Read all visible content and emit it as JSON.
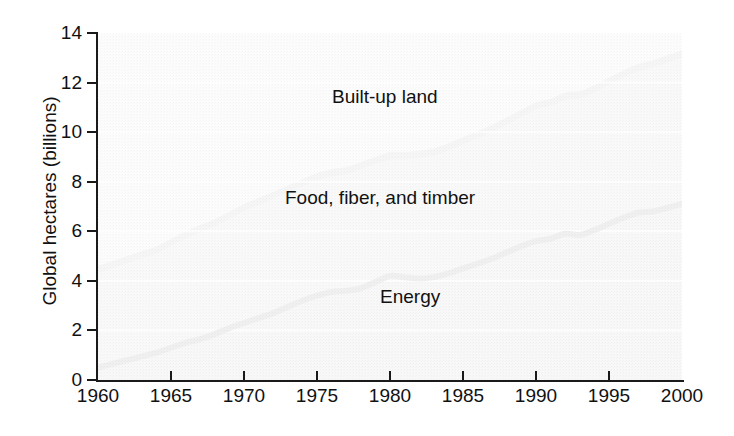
{
  "chart_data": {
    "type": "area",
    "stacked": true,
    "title": "",
    "subtitle": "",
    "xlabel": "",
    "ylabel": "Global hectares (billions)",
    "xlim": [
      1960,
      2000
    ],
    "ylim": [
      0,
      14
    ],
    "x_ticks": [
      1960,
      1965,
      1970,
      1975,
      1980,
      1985,
      1990,
      1995,
      2000
    ],
    "x_tick_labels": [
      "1960",
      "1965",
      "1970",
      "1975",
      "1980",
      "1985",
      "1990",
      "1995",
      "2000"
    ],
    "y_ticks": [
      0,
      2,
      4,
      6,
      8,
      10,
      12,
      14
    ],
    "y_tick_labels": [
      "0",
      "2",
      "4",
      "6",
      "8",
      "10",
      "12",
      "14"
    ],
    "grid": "horizontal-white-lines",
    "legend_position": "in-plot-annotations",
    "annotations": [
      {
        "text": "Built-up land",
        "series": "built-up-land"
      },
      {
        "text": "Food, fiber, and timber",
        "series": "food-fiber-timber"
      },
      {
        "text": "Energy",
        "series": "energy"
      }
    ],
    "colors": {
      "energy_fill": "#b4b4b4",
      "food_fill": "#c3c3c3",
      "builtup_fill": "#e3e3e3",
      "energy_line": "#6e6e6e",
      "builtup_band_edge": "#9e9e9e",
      "axis": "#1a1a1a",
      "gridline": "#ffffff",
      "text": "#111111"
    },
    "x": [
      1960,
      1961,
      1962,
      1963,
      1964,
      1965,
      1966,
      1967,
      1968,
      1969,
      1970,
      1971,
      1972,
      1973,
      1974,
      1975,
      1976,
      1977,
      1978,
      1979,
      1980,
      1981,
      1982,
      1983,
      1984,
      1985,
      1986,
      1987,
      1988,
      1989,
      1990,
      1991,
      1992,
      1993,
      1994,
      1995,
      1996,
      1997,
      1998,
      1999,
      2000
    ],
    "series": [
      {
        "name": "Energy",
        "key": "energy",
        "values": [
          0.5,
          0.65,
          0.8,
          0.95,
          1.1,
          1.3,
          1.5,
          1.65,
          1.85,
          2.1,
          2.3,
          2.5,
          2.7,
          2.95,
          3.2,
          3.4,
          3.55,
          3.6,
          3.7,
          3.95,
          4.2,
          4.15,
          4.1,
          4.15,
          4.3,
          4.5,
          4.7,
          4.9,
          5.15,
          5.4,
          5.6,
          5.7,
          5.9,
          5.85,
          6.05,
          6.3,
          6.55,
          6.75,
          6.8,
          6.95,
          7.1
        ]
      },
      {
        "name": "Food, fiber, and timber",
        "key": "food-fiber-timber",
        "values": [
          3.8,
          3.85,
          3.9,
          3.95,
          4.0,
          4.1,
          4.2,
          4.3,
          4.35,
          4.4,
          4.5,
          4.55,
          4.6,
          4.6,
          4.6,
          4.65,
          4.65,
          4.7,
          4.8,
          4.75,
          4.7,
          4.75,
          4.85,
          4.9,
          4.95,
          5.0,
          5.05,
          5.1,
          5.15,
          5.2,
          5.3,
          5.35,
          5.4,
          5.5,
          5.55,
          5.6,
          5.65,
          5.7,
          5.8,
          5.85,
          5.9
        ]
      },
      {
        "name": "Built-up land",
        "key": "built-up-land",
        "values": [
          0.3,
          0.3,
          0.3,
          0.3,
          0.3,
          0.3,
          0.3,
          0.3,
          0.3,
          0.3,
          0.3,
          0.3,
          0.3,
          0.3,
          0.3,
          0.3,
          0.3,
          0.3,
          0.3,
          0.3,
          0.3,
          0.3,
          0.3,
          0.3,
          0.3,
          0.3,
          0.3,
          0.3,
          0.3,
          0.3,
          0.3,
          0.3,
          0.3,
          0.3,
          0.3,
          0.3,
          0.3,
          0.3,
          0.3,
          0.3,
          0.3
        ]
      }
    ],
    "cumulative": {
      "energy_top": [
        0.5,
        0.65,
        0.8,
        0.95,
        1.1,
        1.3,
        1.5,
        1.65,
        1.85,
        2.1,
        2.3,
        2.5,
        2.7,
        2.95,
        3.2,
        3.4,
        3.55,
        3.6,
        3.7,
        3.95,
        4.2,
        4.15,
        4.1,
        4.15,
        4.3,
        4.5,
        4.7,
        4.9,
        5.15,
        5.4,
        5.6,
        5.7,
        5.9,
        5.85,
        6.05,
        6.3,
        6.55,
        6.75,
        6.8,
        6.95,
        7.1
      ],
      "food_top": [
        4.3,
        4.5,
        4.7,
        4.9,
        5.1,
        5.4,
        5.7,
        5.95,
        6.2,
        6.5,
        6.8,
        7.05,
        7.3,
        7.55,
        7.8,
        8.05,
        8.2,
        8.3,
        8.5,
        8.7,
        8.9,
        8.9,
        8.95,
        9.05,
        9.25,
        9.5,
        9.75,
        10.0,
        10.3,
        10.6,
        10.9,
        11.05,
        11.3,
        11.35,
        11.6,
        11.9,
        12.2,
        12.45,
        12.6,
        12.8,
        13.0
      ],
      "total_top": [
        4.6,
        4.8,
        5.0,
        5.2,
        5.4,
        5.7,
        6.0,
        6.25,
        6.5,
        6.8,
        7.1,
        7.35,
        7.6,
        7.85,
        8.1,
        8.35,
        8.5,
        8.6,
        8.8,
        9.0,
        9.2,
        9.2,
        9.25,
        9.35,
        9.55,
        9.8,
        10.05,
        10.3,
        10.6,
        10.9,
        11.2,
        11.35,
        11.6,
        11.65,
        11.9,
        12.2,
        12.5,
        12.75,
        12.9,
        13.1,
        13.3
      ]
    }
  },
  "axes": {
    "y_title": "Global hectares (billions)",
    "y_ticks": [
      "14",
      "12",
      "10",
      "8",
      "6",
      "4",
      "2",
      "0"
    ],
    "x_ticks": [
      "1960",
      "1965",
      "1970",
      "1975",
      "1980",
      "1985",
      "1990",
      "1995",
      "2000"
    ]
  },
  "labels": {
    "builtup": "Built-up land",
    "food": "Food, fiber, and timber",
    "energy": "Energy"
  }
}
